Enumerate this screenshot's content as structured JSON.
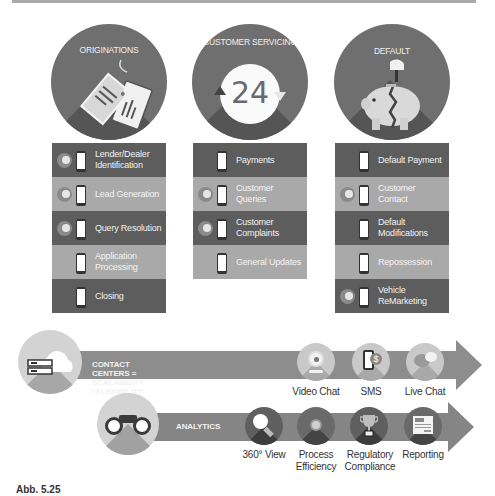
{
  "columns": [
    {
      "title": "ORIGINATIONS",
      "icon": "price-tags-icon",
      "rows": [
        {
          "label": "Lender/Dealer Identification",
          "shade": "dark",
          "badge": true
        },
        {
          "label": "Lead Generation",
          "shade": "light",
          "badge": true
        },
        {
          "label": "Query Resolution",
          "shade": "dark",
          "badge": true
        },
        {
          "label": "Application Processing",
          "shade": "light",
          "badge": false
        },
        {
          "label": "Closing",
          "shade": "dark",
          "badge": false
        }
      ]
    },
    {
      "title": "CUSTOMER SERVICING",
      "icon": "24-hours-icon",
      "icon_text": "24",
      "rows": [
        {
          "label": "Payments",
          "shade": "dark",
          "badge": false
        },
        {
          "label": "Customer Queries",
          "shade": "light",
          "badge": true
        },
        {
          "label": "Customer Complaints",
          "shade": "dark",
          "badge": true
        },
        {
          "label": "General Updates",
          "shade": "light",
          "badge": false
        }
      ]
    },
    {
      "title": "DEFAULT",
      "icon": "broken-piggy-bank-icon",
      "rows": [
        {
          "label": "Default Payment",
          "shade": "dark",
          "badge": false
        },
        {
          "label": "Customer Contact",
          "shade": "light",
          "badge": true
        },
        {
          "label": "Default Modifications",
          "shade": "dark",
          "badge": false
        },
        {
          "label": "Repossession",
          "shade": "light",
          "badge": false
        },
        {
          "label": "Vehicle ReMarketing",
          "shade": "dark",
          "badge": true
        }
      ]
    }
  ],
  "contact_centers": {
    "banner": "CONTACT CENTERS = SCALABILITY / FLEXIBILITY",
    "icon": "cloud-server-icon",
    "channels": [
      {
        "label": "Video Chat",
        "icon": "webcam-icon"
      },
      {
        "label": "SMS",
        "icon": "phone-dollar-icon"
      },
      {
        "label": "Live Chat",
        "icon": "chat-bubbles-icon"
      }
    ]
  },
  "analytics": {
    "banner": "ANALYTICS",
    "icon": "binoculars-icon",
    "items": [
      {
        "label": "360° View",
        "icon": "magnifier-icon"
      },
      {
        "label": "Process Efficiency",
        "icon": "target-icon"
      },
      {
        "label": "Regulatory Compliance",
        "icon": "trophy-icon"
      },
      {
        "label": "Reporting",
        "icon": "report-document-icon"
      }
    ]
  },
  "caption": {
    "text": "Abb. 5.25"
  },
  "colors": {
    "dark_row": "#5d5d5d",
    "light_row": "#a9a9a9",
    "circle": "#6f6f6f",
    "arrow": "#8d8d8d"
  }
}
